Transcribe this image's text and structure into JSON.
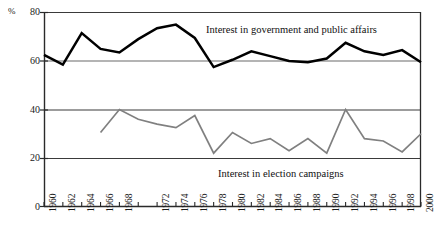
{
  "axis": {
    "unit_label": "%",
    "y_ticks": [
      80,
      60,
      40,
      20,
      0
    ],
    "x_ticks": [
      "1960",
      "1962",
      "1964",
      "1966",
      "1968",
      "1972",
      "1974",
      "1976",
      "1978",
      "1980",
      "1982",
      "1984",
      "1986",
      "1988",
      "1990",
      "1992",
      "1994",
      "1996",
      "1998",
      "2000"
    ]
  },
  "annotations": {
    "series1": "Interest in government and public affairs",
    "series2": "Interest in election campaigns"
  },
  "colors": {
    "series1": "#000000",
    "series2": "#808080",
    "gridline": "#555555",
    "axis": "#333333"
  },
  "chart_data": {
    "type": "line",
    "title": "",
    "xlabel": "",
    "ylabel": "%",
    "ylim": [
      0,
      80
    ],
    "yticks": [
      0,
      20,
      40,
      60,
      80
    ],
    "grid": "horizontal",
    "legend": "inline-annotations",
    "x": [
      1960,
      1962,
      1964,
      1966,
      1968,
      1970,
      1972,
      1974,
      1976,
      1978,
      1980,
      1982,
      1984,
      1986,
      1988,
      1990,
      1992,
      1994,
      1996,
      1998,
      2000
    ],
    "xtick_labels": [
      "1960",
      "1962",
      "1964",
      "1966",
      "1968",
      "",
      "1972",
      "1974",
      "1976",
      "1978",
      "1980",
      "1982",
      "1984",
      "1986",
      "1988",
      "1990",
      "1992",
      "1994",
      "1996",
      "1998",
      "2000"
    ],
    "series": [
      {
        "name": "Interest in government and public affairs",
        "color": "#000000",
        "x": [
          1960,
          1962,
          1964,
          1966,
          1968,
          1970,
          1972,
          1974,
          1976,
          1978,
          1980,
          1982,
          1984,
          1986,
          1988,
          1990,
          1992,
          1994,
          1996,
          1998,
          2000
        ],
        "values": [
          62.5,
          58.5,
          71.5,
          65.0,
          63.5,
          69.0,
          73.5,
          75.0,
          69.5,
          57.5,
          60.5,
          64.0,
          62.0,
          60.0,
          59.5,
          61.0,
          67.5,
          64.0,
          62.5,
          64.5,
          59.5
        ]
      },
      {
        "name": "Interest in election campaigns",
        "color": "#808080",
        "x": [
          1966,
          1968,
          1970,
          1972,
          1974,
          1976,
          1978,
          1980,
          1982,
          1984,
          1986,
          1988,
          1990,
          1992,
          1994,
          1996,
          1998,
          2000
        ],
        "values": [
          30.5,
          40.0,
          36.0,
          34.0,
          32.5,
          37.5,
          22.0,
          30.5,
          26.0,
          28.0,
          23.0,
          28.0,
          22.0,
          40.0,
          28.0,
          27.0,
          22.5,
          30.0
        ]
      }
    ]
  }
}
